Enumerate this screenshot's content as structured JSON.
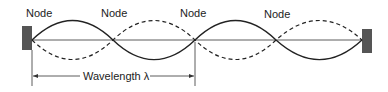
{
  "diagram": {
    "node_labels": [
      "Node",
      "Node",
      "Node",
      "Node"
    ],
    "wavelength_label": "Wavelength λ",
    "colors": {
      "wall": "#555555",
      "wave": "#222222",
      "text": "#222222"
    }
  }
}
